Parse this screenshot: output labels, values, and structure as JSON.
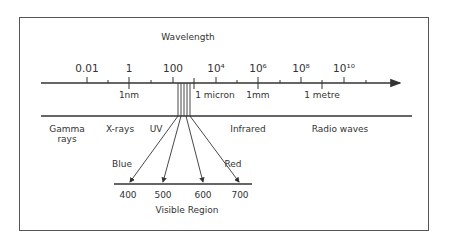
{
  "title": "Wavelength",
  "scale_labels": [
    {
      "text": "0.01",
      "x": 87
    },
    {
      "text": "1",
      "x": 129
    },
    {
      "text": "100",
      "x": 173
    },
    {
      "text": "10⁴",
      "x": 216
    },
    {
      "text": "10⁶",
      "x": 258
    },
    {
      "text": "10⁸",
      "x": 301
    },
    {
      "text": "10¹⁰",
      "x": 344
    }
  ],
  "unit_labels": [
    {
      "text": "1nm",
      "x": 129
    },
    {
      "text": "1 micron",
      "x": 215
    },
    {
      "text": "1mm",
      "x": 258
    },
    {
      "text": "1 metre",
      "x": 322
    }
  ],
  "regions": {
    "gamma_line1": "Gamma",
    "gamma_line2": "rays",
    "xrays": "X-rays",
    "uv": "UV",
    "infrared": "Infrared",
    "radio": "Radio waves"
  },
  "visible": {
    "blue": "Blue",
    "red": "Red",
    "ticks": [
      "400",
      "500",
      "600",
      "700"
    ],
    "caption": "Visible Region"
  },
  "colors": {
    "line": "#333333",
    "frame": "#555555",
    "background": "#ffffff"
  }
}
